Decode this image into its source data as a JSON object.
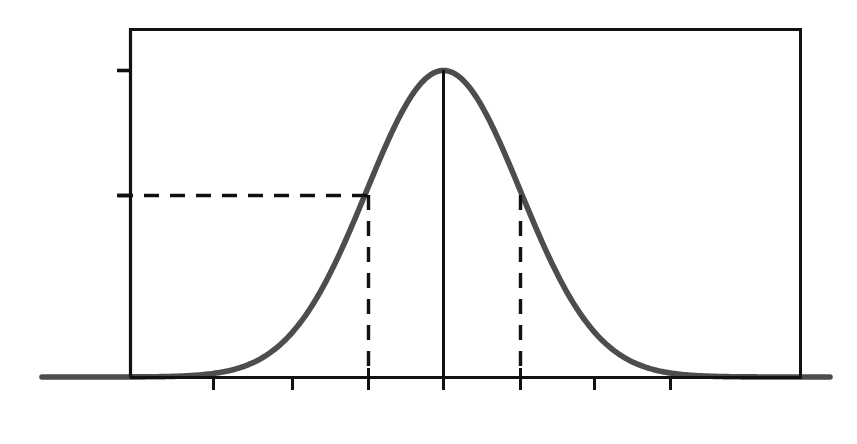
{
  "figure": {
    "background_color": "#ffffff",
    "axis_color": "#111111",
    "curve_color": "#4a4a4a",
    "dash_color": "#111111"
  },
  "axes": {
    "y_title": "Wahrscheinlichkeitsdichte",
    "x_title": "x",
    "y_ticks": [
      {
        "id": "gmax",
        "base": "G",
        "sub": "max",
        "value_label": "G_max"
      },
      {
        "id": "gmax-over-sqrt-e",
        "numerator_base": "G",
        "numerator_sub": "max",
        "denominator": "√e",
        "value_label": "G_max/√e"
      }
    ],
    "x_tick_labels": [
      {
        "id": "mu-minus-sigma",
        "text": "μ-σ"
      },
      {
        "id": "mu",
        "text": "μ"
      },
      {
        "id": "mu-plus-sigma",
        "text": "μ+σ"
      }
    ]
  },
  "chart_data": {
    "type": "line",
    "title": "",
    "subtitle": "",
    "xlabel": "x",
    "ylabel": "Wahrscheinlichkeitsdichte",
    "curve": "gaussian",
    "mu": 0,
    "sigma": 1,
    "peak_value_label": "G_max",
    "sigma_level_value_label": "G_max/√e",
    "sigma_level_ratio": 0.6065,
    "x_range": [
      -3.9,
      4.2
    ],
    "y_range": [
      0,
      1.08
    ],
    "grid": false,
    "legend": null,
    "annotations": [
      {
        "id": "gmax-tick",
        "kind": "y-tick",
        "label": "G_max",
        "y": 1.0
      },
      {
        "id": "gmax-sqrte-tick",
        "kind": "y-tick",
        "label": "G_max/√e",
        "y": 0.6065
      },
      {
        "id": "mu-vline",
        "kind": "vertical-line",
        "style": "solid",
        "x": 0,
        "y_from": 0,
        "y_to": 1.0
      },
      {
        "id": "sigma-level-hline",
        "kind": "horizontal-line",
        "style": "dashed",
        "y": 0.6065,
        "x_from": -3.9,
        "x_to": -1
      },
      {
        "id": "mu-minus-sigma-vline",
        "kind": "vertical-line",
        "style": "dashed",
        "x": -1,
        "y_from": 0,
        "y_to": 0.6065
      },
      {
        "id": "mu-plus-sigma-vline",
        "kind": "vertical-line",
        "style": "dashed",
        "x": 1,
        "y_from": 0,
        "y_to": 0.6065
      }
    ],
    "x_tick_values": [
      -3.9,
      -2.85,
      -1.85,
      -1,
      0,
      1,
      1.95,
      2.9,
      4.2
    ],
    "x_tick_labeled": {
      "-1": "μ-σ",
      "0": "μ",
      "1": "μ+σ"
    }
  }
}
